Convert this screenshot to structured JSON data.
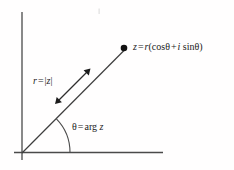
{
  "figure": {
    "background_color": "#ffffff",
    "stroke_color": "#4a4a4a",
    "text_color": "#1c1c1c",
    "labels": {
      "point_label": {
        "full_text": "z = r(cosθ + i sinθ)",
        "lhs": "z",
        "equals": "=",
        "radius_symbol": "r",
        "open_paren": "(",
        "cos_term": "cos",
        "theta_1": "θ",
        "plus": "+",
        "imaginary_unit": "i",
        "sin_term": "sin",
        "theta_2": "θ",
        "close_paren": ")"
      },
      "radius_label": {
        "full_text": "r = |z|",
        "lhs": "r",
        "equals": "=",
        "bar_open": "|",
        "modulus_arg": "z",
        "bar_close": "|"
      },
      "angle_label": {
        "full_text": "θ = arg z",
        "lhs": "θ",
        "equals": "=",
        "function": "arg",
        "argument": "z"
      }
    },
    "geometry": {
      "origin": [
        22,
        153
      ],
      "vertical_axis": [
        22,
        12,
        22,
        160
      ],
      "horizontal_axis": [
        14,
        152,
        163,
        152
      ],
      "ray_start": [
        22,
        153
      ],
      "ray_end": [
        126,
        49
      ],
      "point_marker": [
        124,
        48
      ],
      "point_marker_radius": 3.2,
      "angle_arc_radius": 48,
      "angle_degrees": 45,
      "measure_arrow_start": [
        56,
        103
      ],
      "measure_arrow_end": [
        90,
        69
      ]
    }
  }
}
